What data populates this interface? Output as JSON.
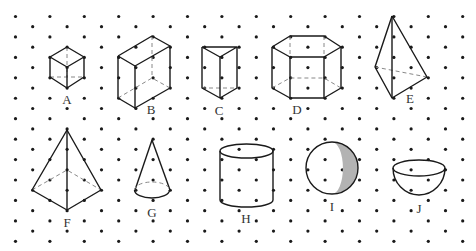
{
  "clipped_header_text": "... y ... y ... g ... p ...",
  "grid": {
    "dot_color": "#1a1a1a",
    "dot_radius": 1.6,
    "x0": 15.5,
    "dx": 34.4,
    "y0": 16.5,
    "dy": 10.22,
    "rows": 23,
    "cols": 14
  },
  "style": {
    "stroke": "#1a1a1a",
    "hidden_stroke": "#888888",
    "shade": "#b3b3b3"
  },
  "figures": [
    {
      "label": "A",
      "name": "cube",
      "label_pos": [
        67,
        104
      ],
      "solid": [
        [
          [
            67,
            47
          ],
          [
            84,
            57
          ],
          [
            84,
            77
          ],
          [
            67,
            88
          ],
          [
            50,
            77
          ],
          [
            50,
            57
          ],
          [
            67,
            47
          ]
        ],
        [
          [
            50,
            57
          ],
          [
            67,
            67
          ],
          [
            84,
            57
          ]
        ],
        [
          [
            67,
            67
          ],
          [
            67,
            88
          ]
        ]
      ],
      "hidden": [
        [
          [
            67,
            47
          ],
          [
            67,
            77
          ]
        ],
        [
          [
            50,
            77
          ],
          [
            67,
            77
          ],
          [
            84,
            77
          ]
        ]
      ]
    },
    {
      "label": "B",
      "name": "cuboid",
      "label_pos": [
        151,
        114
      ],
      "solid": [
        [
          [
            118,
            56
          ],
          [
            152,
            36
          ],
          [
            170,
            46
          ],
          [
            135,
            66
          ],
          [
            118,
            56
          ]
        ],
        [
          [
            118,
            56
          ],
          [
            118,
            98
          ],
          [
            135,
            108
          ],
          [
            170,
            88
          ],
          [
            170,
            46
          ]
        ],
        [
          [
            135,
            66
          ],
          [
            135,
            108
          ]
        ]
      ],
      "hidden": [
        [
          [
            152,
            36
          ],
          [
            152,
            78
          ]
        ],
        [
          [
            118,
            98
          ],
          [
            152,
            78
          ],
          [
            170,
            88
          ]
        ]
      ]
    },
    {
      "label": "C",
      "name": "triangular-prism",
      "label_pos": [
        219,
        115
      ],
      "solid": [
        [
          [
            202,
            47
          ],
          [
            237,
            47
          ],
          [
            220,
            57
          ],
          [
            202,
            47
          ]
        ],
        [
          [
            202,
            47
          ],
          [
            202,
            88
          ],
          [
            220,
            98
          ],
          [
            237,
            88
          ],
          [
            237,
            47
          ]
        ],
        [
          [
            220,
            57
          ],
          [
            220,
            98
          ]
        ]
      ],
      "hidden": [
        [
          [
            202,
            88
          ],
          [
            237,
            88
          ]
        ]
      ]
    },
    {
      "label": "D",
      "name": "hexagonal-prism",
      "label_pos": [
        297,
        114
      ],
      "solid": [
        [
          [
            272,
            47
          ],
          [
            290,
            36
          ],
          [
            324,
            36
          ],
          [
            341,
            47
          ],
          [
            324,
            57
          ],
          [
            290,
            57
          ],
          [
            272,
            47
          ]
        ],
        [
          [
            272,
            47
          ],
          [
            272,
            88
          ],
          [
            290,
            98
          ],
          [
            324,
            98
          ],
          [
            341,
            88
          ],
          [
            341,
            47
          ]
        ],
        [
          [
            290,
            57
          ],
          [
            290,
            98
          ]
        ],
        [
          [
            324,
            57
          ],
          [
            324,
            98
          ]
        ]
      ],
      "hidden": [
        [
          [
            290,
            36
          ],
          [
            290,
            57
          ]
        ],
        [
          [
            324,
            36
          ],
          [
            324,
            57
          ]
        ],
        [
          [
            272,
            88
          ],
          [
            290,
            78
          ],
          [
            324,
            78
          ],
          [
            341,
            88
          ]
        ]
      ]
    },
    {
      "label": "E",
      "name": "tetrahedron",
      "label_pos": [
        410,
        103
      ],
      "solid": [
        [
          [
            392,
            16
          ],
          [
            375,
            67
          ],
          [
            392,
            98
          ],
          [
            427,
            77
          ],
          [
            392,
            16
          ]
        ],
        [
          [
            392,
            16
          ],
          [
            392,
            98
          ]
        ]
      ],
      "hidden": [
        [
          [
            375,
            67
          ],
          [
            427,
            77
          ]
        ]
      ]
    },
    {
      "label": "F",
      "name": "square-pyramid",
      "label_pos": [
        67,
        227
      ],
      "solid": [
        [
          [
            67,
            130
          ],
          [
            32,
            190
          ],
          [
            67,
            210
          ],
          [
            101,
            190
          ],
          [
            67,
            130
          ]
        ],
        [
          [
            67,
            130
          ],
          [
            67,
            210
          ]
        ]
      ],
      "hidden": [
        [
          [
            32,
            190
          ],
          [
            67,
            170
          ],
          [
            101,
            190
          ]
        ]
      ]
    },
    {
      "label": "G",
      "name": "cone",
      "label_pos": [
        152,
        217
      ],
      "solid": [
        [
          [
            152,
            140
          ],
          [
            135,
            190
          ]
        ],
        [
          [
            152,
            140
          ],
          [
            170,
            190
          ]
        ]
      ],
      "hidden": [],
      "ellipses": [
        {
          "cx": 152,
          "cy": 190,
          "rx": 17.5,
          "ry": 8,
          "front": "solid",
          "back": "dashed"
        }
      ]
    },
    {
      "label": "H",
      "name": "cylinder",
      "label_pos": [
        246,
        223
      ],
      "solid": [
        [
          [
            220,
            151
          ],
          [
            220,
            200
          ]
        ],
        [
          [
            273,
            151
          ],
          [
            273,
            200
          ]
        ]
      ],
      "hidden": [],
      "ellipses": [
        {
          "cx": 246.5,
          "cy": 151,
          "rx": 26.5,
          "ry": 7,
          "front": "solid",
          "back": "solid"
        },
        {
          "cx": 246.5,
          "cy": 200,
          "rx": 26.5,
          "ry": 7,
          "front": "solid",
          "back": "none"
        }
      ]
    },
    {
      "label": "I",
      "name": "sphere",
      "label_pos": [
        332,
        211
      ],
      "circle": {
        "cx": 332,
        "cy": 168,
        "r": 26
      },
      "crescent": true
    },
    {
      "label": "J",
      "name": "hemisphere",
      "label_pos": [
        419,
        213
      ],
      "bowl": {
        "cx": 419,
        "cy": 168,
        "rx": 26,
        "ry": 8,
        "depth": 27
      }
    }
  ]
}
